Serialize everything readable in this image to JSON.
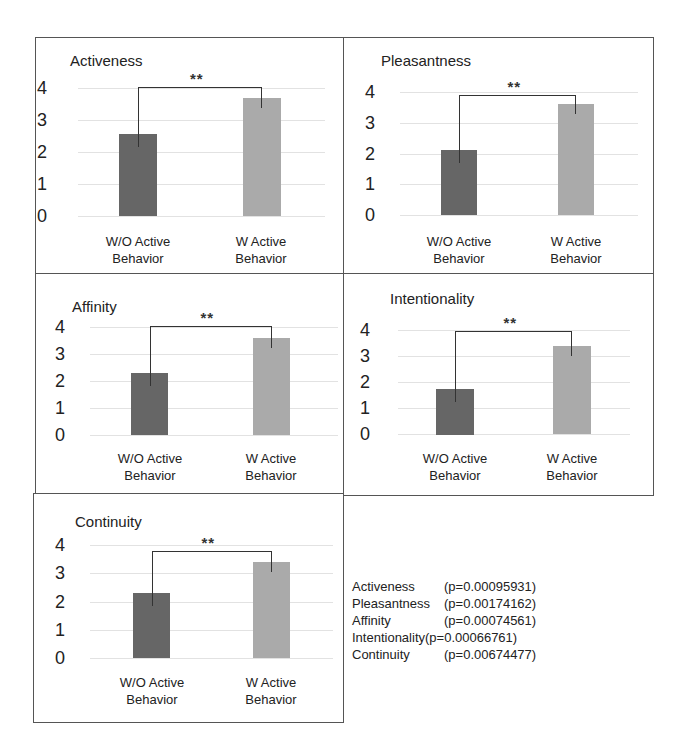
{
  "chart_data": [
    {
      "type": "bar",
      "title": "Activeness",
      "categories": [
        "W/O Active Behavior",
        "W Active Behavior"
      ],
      "values": [
        2.55,
        3.7
      ],
      "ylim": [
        0,
        4
      ],
      "yticks": [
        0,
        1,
        2,
        3,
        4
      ],
      "grid": true,
      "significance": "**",
      "xlabel": "",
      "ylabel": ""
    },
    {
      "type": "bar",
      "title": "Pleasantness",
      "categories": [
        "W/O Active Behavior",
        "W Active Behavior"
      ],
      "values": [
        2.1,
        3.6
      ],
      "ylim": [
        0,
        4
      ],
      "yticks": [
        0,
        1,
        2,
        3,
        4
      ],
      "grid": true,
      "significance": "**",
      "xlabel": "",
      "ylabel": ""
    },
    {
      "type": "bar",
      "title": "Affinity",
      "categories": [
        "W/O Active Behavior",
        "W Active Behavior"
      ],
      "values": [
        2.3,
        3.6
      ],
      "ylim": [
        0,
        4
      ],
      "yticks": [
        0,
        1,
        2,
        3,
        4
      ],
      "grid": true,
      "significance": "**",
      "xlabel": "",
      "ylabel": ""
    },
    {
      "type": "bar",
      "title": "Intentionality",
      "categories": [
        "W/O Active Behavior",
        "W Active Behavior"
      ],
      "values": [
        1.75,
        3.4
      ],
      "ylim": [
        0,
        4
      ],
      "yticks": [
        0,
        1,
        2,
        3,
        4
      ],
      "grid": true,
      "significance": "**",
      "xlabel": "",
      "ylabel": ""
    },
    {
      "type": "bar",
      "title": "Continuity",
      "categories": [
        "W/O Active Behavior",
        "W Active Behavior"
      ],
      "values": [
        2.3,
        3.4
      ],
      "ylim": [
        0,
        4
      ],
      "yticks": [
        0,
        1,
        2,
        3,
        4
      ],
      "grid": true,
      "significance": "**",
      "xlabel": "",
      "ylabel": ""
    }
  ],
  "labels": {
    "cat1_line1": "W/O Active",
    "cat1_line2": "Behavior",
    "cat2_line1": "W Active",
    "cat2_line2": "Behavior",
    "stars": "**",
    "ticks": [
      "4",
      "3",
      "2",
      "1",
      "0"
    ]
  },
  "colors": {
    "without_active": "#666666",
    "with_active": "#aaaaaa"
  },
  "pvalues": [
    {
      "name": "Activeness",
      "p": "(p=0.00095931)"
    },
    {
      "name": "Pleasantness",
      "p": "(p=0.00174162)"
    },
    {
      "name": "Affinity",
      "p": "(p=0.00074561)"
    },
    {
      "name": "Intentionality",
      "p": "(p=0.00066761)"
    },
    {
      "name": "Continuity",
      "p": "(p=0.00674477)"
    }
  ]
}
